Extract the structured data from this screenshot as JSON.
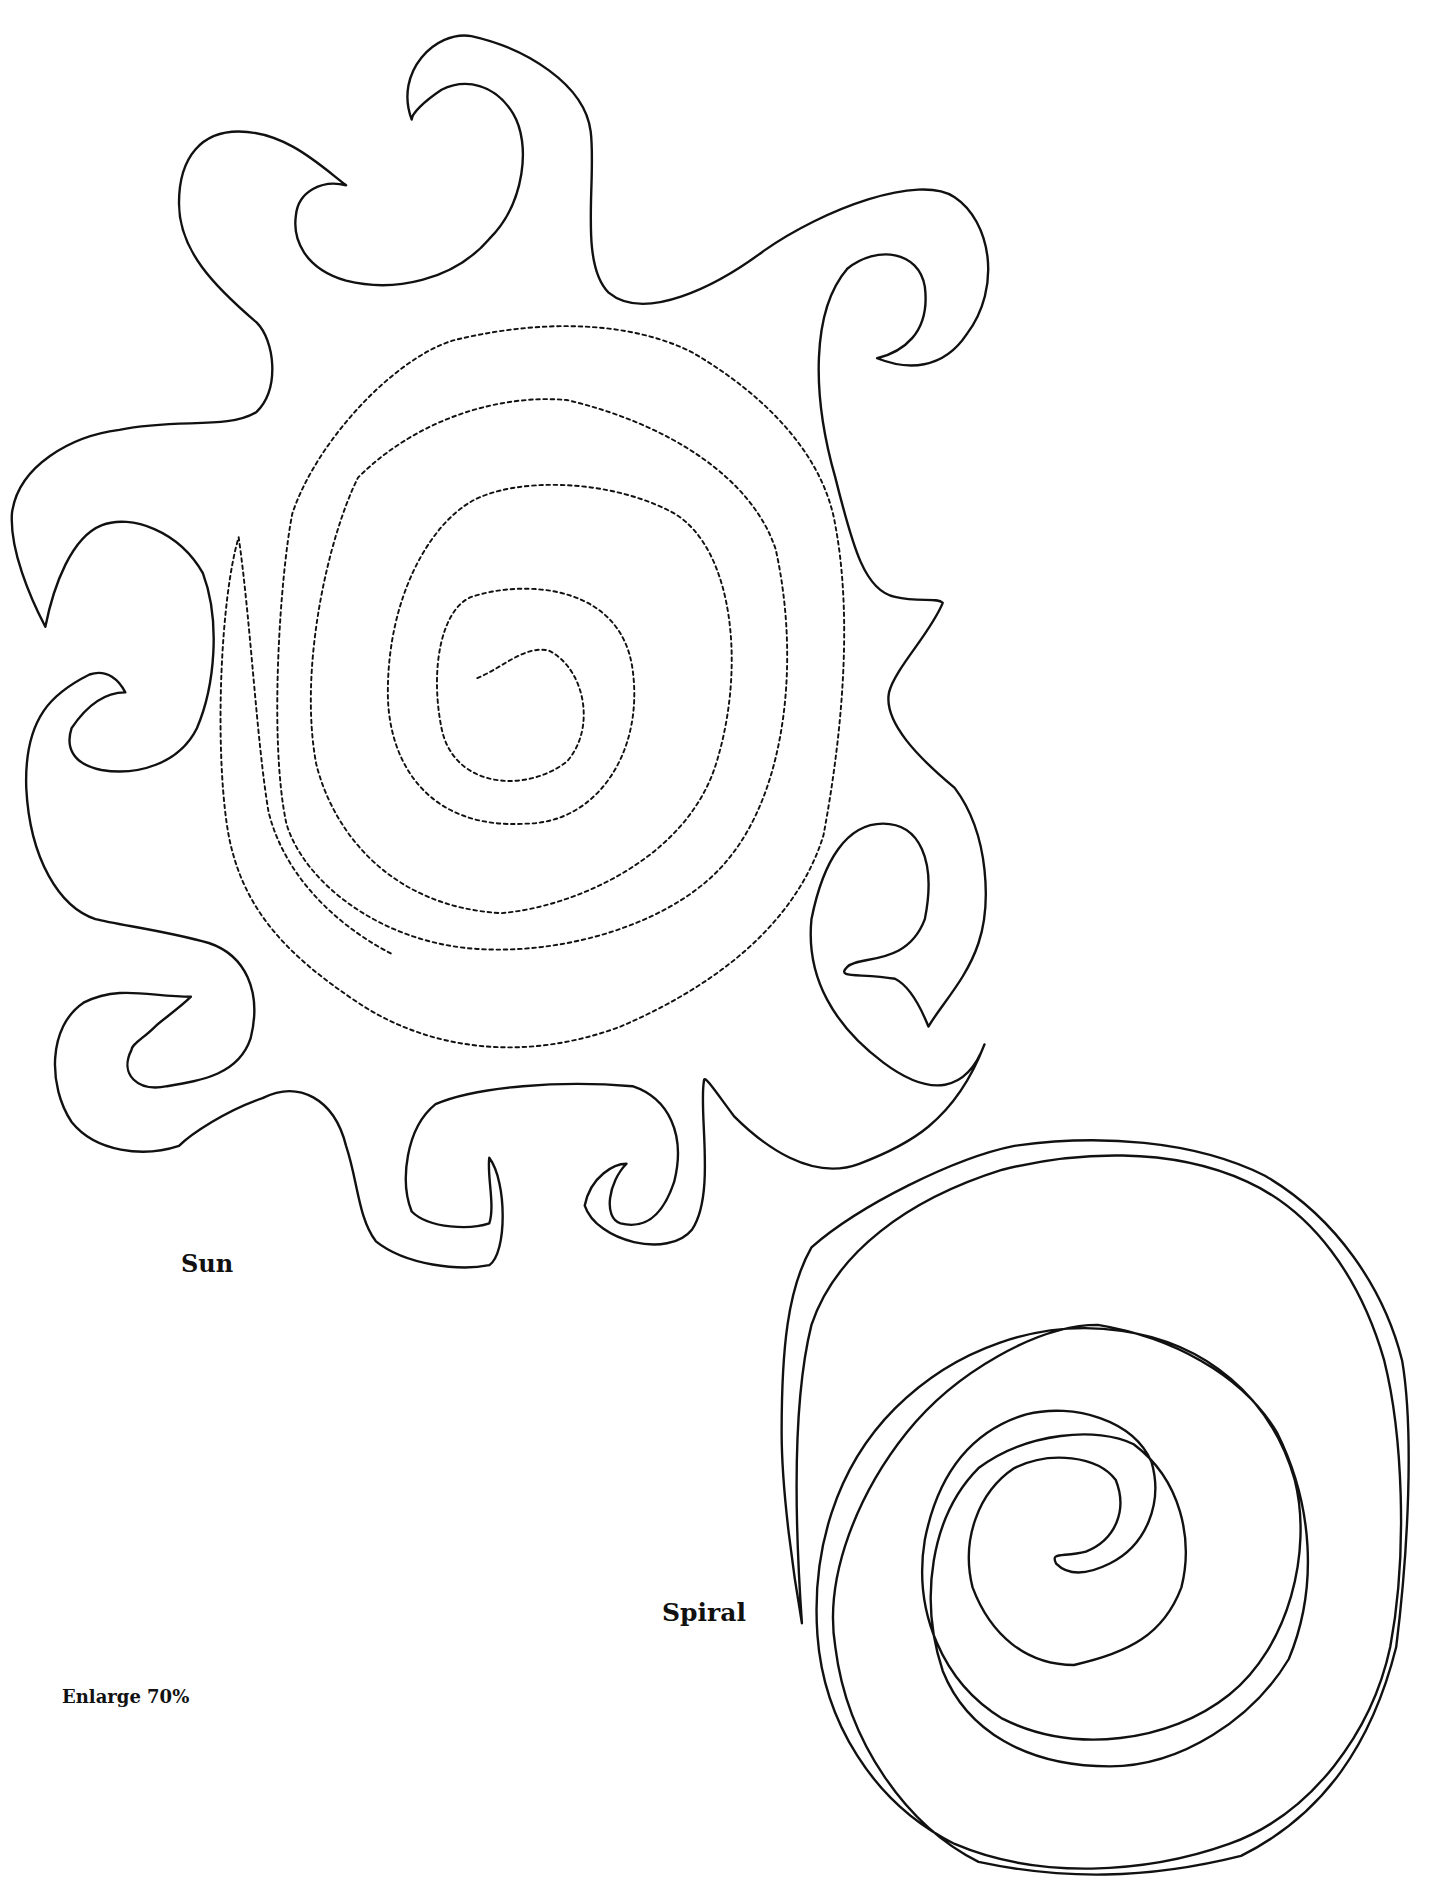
{
  "page": {
    "type": "craft pattern template",
    "background": "#ffffff",
    "line_color": "#111111"
  },
  "patterns": [
    {
      "id": "sun",
      "label": "Sun",
      "outline": "solid wavy sun with 11 curled rays",
      "inner_guide": "dotted spiral"
    },
    {
      "id": "spiral",
      "label": "Spiral",
      "outline": "solid spiral strip with pointed tail"
    }
  ],
  "note": {
    "text": "Enlarge 70%"
  }
}
